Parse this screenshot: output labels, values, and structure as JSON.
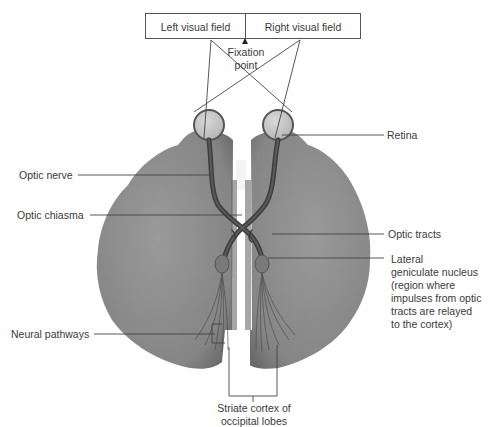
{
  "visual_field": {
    "left_label": "Left visual field",
    "right_label": "Right visual field",
    "fixation_point": "Fixation\npoint"
  },
  "labels": {
    "retina": "Retina",
    "optic_nerve": "Optic nerve",
    "optic_chiasma": "Optic chiasma",
    "optic_tracts": "Optic tracts",
    "lateral_geniculate": [
      "Lateral",
      "geniculate nucleus",
      "(region where",
      "impulses from optic",
      "tracts are relayed",
      "to the cortex)"
    ],
    "neural_pathways": "Neural pathways",
    "striate_cortex": [
      "Striate cortex of",
      "occipital lobes"
    ]
  },
  "colors": {
    "brain": "#8a8a8a",
    "brain_dark": "#6e6e6e",
    "eye": "#c9c9c9",
    "nerve": "#444444",
    "line": "#444444"
  }
}
